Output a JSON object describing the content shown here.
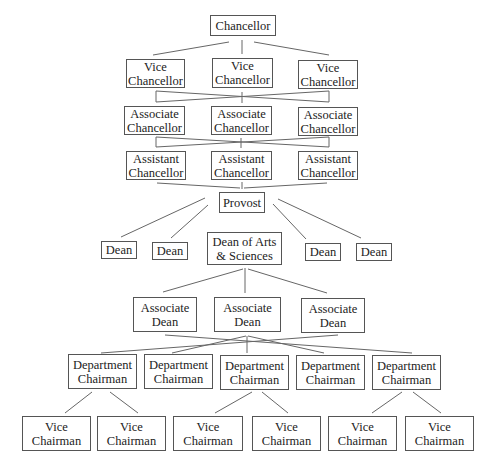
{
  "diagram": {
    "type": "org-chart",
    "nodes": [
      {
        "id": "chancellor",
        "label": "Chancellor",
        "x": 210,
        "y": 15,
        "w": 66,
        "h": 21
      },
      {
        "id": "vc1",
        "label": "Vice\nChancellor",
        "x": 126,
        "y": 59,
        "w": 59,
        "h": 29
      },
      {
        "id": "vc2",
        "label": "Vice\nChancellor",
        "x": 212,
        "y": 58,
        "w": 61,
        "h": 30
      },
      {
        "id": "vc3",
        "label": "Vice\nChancellor",
        "x": 298,
        "y": 60,
        "w": 60,
        "h": 29
      },
      {
        "id": "ac1",
        "label": "Associate\nChancellor",
        "x": 124,
        "y": 106,
        "w": 61,
        "h": 29
      },
      {
        "id": "ac2",
        "label": "Associate\nChancellor",
        "x": 211,
        "y": 106,
        "w": 61,
        "h": 29
      },
      {
        "id": "ac3",
        "label": "Associate\nChancellor",
        "x": 298,
        "y": 107,
        "w": 60,
        "h": 29
      },
      {
        "id": "as1",
        "label": "Assistant\nChancellor",
        "x": 126,
        "y": 151,
        "w": 60,
        "h": 29
      },
      {
        "id": "as2",
        "label": "Assistant\nChancellor",
        "x": 211,
        "y": 151,
        "w": 61,
        "h": 29
      },
      {
        "id": "as3",
        "label": "Assistant\nChancellor",
        "x": 298,
        "y": 151,
        "w": 60,
        "h": 29
      },
      {
        "id": "provost",
        "label": "Provost",
        "x": 219,
        "y": 192,
        "w": 46,
        "h": 21
      },
      {
        "id": "dean1",
        "label": "Dean",
        "x": 101,
        "y": 241,
        "w": 36,
        "h": 18
      },
      {
        "id": "dean2",
        "label": "Dean",
        "x": 152,
        "y": 242,
        "w": 36,
        "h": 18
      },
      {
        "id": "deanarts",
        "label": "Dean of Arts\n& Sciences",
        "x": 207,
        "y": 232,
        "w": 75,
        "h": 33
      },
      {
        "id": "dean3",
        "label": "Dean",
        "x": 305,
        "y": 243,
        "w": 36,
        "h": 18
      },
      {
        "id": "dean4",
        "label": "Dean",
        "x": 356,
        "y": 243,
        "w": 36,
        "h": 18
      },
      {
        "id": "ad1",
        "label": "Associate\nDean",
        "x": 133,
        "y": 297,
        "w": 64,
        "h": 35
      },
      {
        "id": "ad2",
        "label": "Associate\nDean",
        "x": 214,
        "y": 297,
        "w": 67,
        "h": 35
      },
      {
        "id": "ad3",
        "label": "Associate\nDean",
        "x": 301,
        "y": 298,
        "w": 64,
        "h": 35
      },
      {
        "id": "dc1",
        "label": "Department\nChairman",
        "x": 68,
        "y": 354,
        "w": 69,
        "h": 35
      },
      {
        "id": "dc2",
        "label": "Department\nChairman",
        "x": 144,
        "y": 354,
        "w": 69,
        "h": 35
      },
      {
        "id": "dc3",
        "label": "Department\nChairman",
        "x": 220,
        "y": 355,
        "w": 69,
        "h": 35
      },
      {
        "id": "dc4",
        "label": "Department\nChairman",
        "x": 296,
        "y": 355,
        "w": 69,
        "h": 35
      },
      {
        "id": "dc5",
        "label": "Department\nChairman",
        "x": 372,
        "y": 355,
        "w": 69,
        "h": 35
      },
      {
        "id": "vch1",
        "label": "Vice\nChairman",
        "x": 22,
        "y": 416,
        "w": 69,
        "h": 35
      },
      {
        "id": "vch2",
        "label": "Vice\nChairman",
        "x": 97,
        "y": 416,
        "w": 69,
        "h": 35
      },
      {
        "id": "vch3",
        "label": "Vice\nChairman",
        "x": 173,
        "y": 416,
        "w": 70,
        "h": 35
      },
      {
        "id": "vch4",
        "label": "Vice\nChairman",
        "x": 252,
        "y": 416,
        "w": 69,
        "h": 35
      },
      {
        "id": "vch5",
        "label": "Vice\nChairman",
        "x": 328,
        "y": 416,
        "w": 69,
        "h": 35
      },
      {
        "id": "vch6",
        "label": "Vice\nChairman",
        "x": 405,
        "y": 416,
        "w": 69,
        "h": 35
      }
    ],
    "lines": [
      [
        229,
        42,
        153,
        55
      ],
      [
        242,
        40,
        242,
        54
      ],
      [
        254,
        42,
        329,
        55
      ],
      [
        156,
        91,
        329,
        102
      ],
      [
        156,
        102,
        329,
        91
      ],
      [
        156,
        91,
        156,
        102
      ],
      [
        329,
        91,
        329,
        102
      ],
      [
        242,
        92,
        242,
        103
      ],
      [
        156,
        137,
        329,
        147
      ],
      [
        156,
        147,
        329,
        137
      ],
      [
        156,
        137,
        156,
        147
      ],
      [
        329,
        137,
        329,
        147
      ],
      [
        241,
        138,
        241,
        148
      ],
      [
        157,
        183,
        240,
        188
      ],
      [
        242,
        182,
        242,
        189
      ],
      [
        327,
        183,
        244,
        188
      ],
      [
        205,
        198,
        121,
        237
      ],
      [
        208,
        205,
        171,
        238
      ],
      [
        273,
        204,
        306,
        239
      ],
      [
        278,
        199,
        361,
        238
      ],
      [
        243,
        269,
        163,
        292
      ],
      [
        245,
        268,
        245,
        293
      ],
      [
        248,
        269,
        327,
        293
      ],
      [
        165,
        335,
        412,
        353
      ],
      [
        338,
        335,
        101,
        353
      ],
      [
        246,
        336,
        172,
        353
      ],
      [
        248,
        336,
        324,
        353
      ],
      [
        247,
        336,
        247,
        353
      ],
      [
        92,
        392,
        65,
        413
      ],
      [
        110,
        392,
        138,
        413
      ],
      [
        252,
        392,
        215,
        413
      ],
      [
        262,
        392,
        288,
        413
      ],
      [
        402,
        392,
        372,
        413
      ],
      [
        413,
        392,
        441,
        413
      ]
    ],
    "line_color": "#666666"
  }
}
